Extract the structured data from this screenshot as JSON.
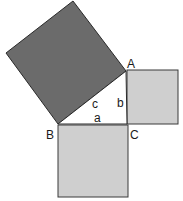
{
  "diagram": {
    "vertices": {
      "A": {
        "label": "A"
      },
      "B": {
        "label": "B"
      },
      "C": {
        "label": "C"
      }
    },
    "sides": {
      "a": {
        "label": "a"
      },
      "b": {
        "label": "b"
      },
      "c": {
        "label": "c"
      }
    },
    "colors": {
      "hypotenuse_square": "#6b6b6b",
      "leg_squares": "#cfcfcf",
      "triangle": "#ffffff",
      "stroke": "#2a2a2a"
    }
  }
}
